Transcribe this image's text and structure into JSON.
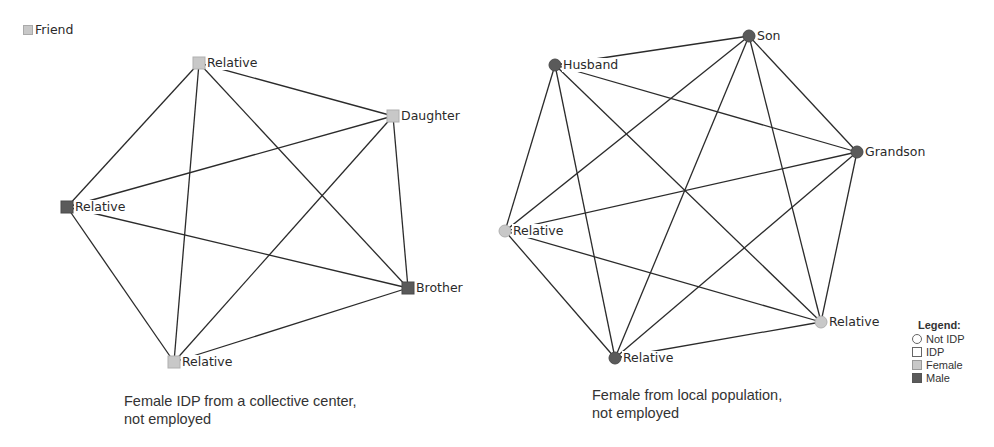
{
  "colors": {
    "edge": "#2b2b2b",
    "female": "#c8c8c8",
    "male": "#5a5a5a",
    "background": "#ffffff"
  },
  "top_legend": {
    "label": "Friend",
    "shape": "square",
    "gender": "female"
  },
  "graphs": [
    {
      "id": "left",
      "shape": "square",
      "caption_line1": "Female IDP from a collective center,",
      "caption_line2": "not employed",
      "nodes": [
        {
          "label": "Relative",
          "gender": "female",
          "x": 199,
          "y": 63
        },
        {
          "label": "Daughter",
          "gender": "female",
          "x": 393,
          "y": 116
        },
        {
          "label": "Relative",
          "gender": "male",
          "x": 67,
          "y": 207
        },
        {
          "label": "Brother",
          "gender": "male",
          "x": 408,
          "y": 288
        },
        {
          "label": "Relative",
          "gender": "female",
          "x": 174,
          "y": 362
        }
      ],
      "edges": "complete"
    },
    {
      "id": "right",
      "shape": "circle",
      "caption_line1": "Female from local population,",
      "caption_line2": "not employed",
      "nodes": [
        {
          "label": "Husband",
          "gender": "male",
          "x": 555,
          "y": 65
        },
        {
          "label": "Son",
          "gender": "male",
          "x": 749,
          "y": 36
        },
        {
          "label": "Grandson",
          "gender": "male",
          "x": 857,
          "y": 152
        },
        {
          "label": "Relative",
          "gender": "female",
          "x": 505,
          "y": 231
        },
        {
          "label": "Relative",
          "gender": "female",
          "x": 821,
          "y": 322
        },
        {
          "label": "Relative",
          "gender": "male",
          "x": 615,
          "y": 358
        }
      ],
      "edges": "complete"
    }
  ],
  "legend": {
    "title": "Legend:",
    "items": [
      {
        "label": "Not IDP",
        "icon": "circle-outline"
      },
      {
        "label": "IDP",
        "icon": "square-outline"
      },
      {
        "label": "Female",
        "icon": "square-light-gray"
      },
      {
        "label": "Male",
        "icon": "square-dark-gray"
      }
    ]
  }
}
